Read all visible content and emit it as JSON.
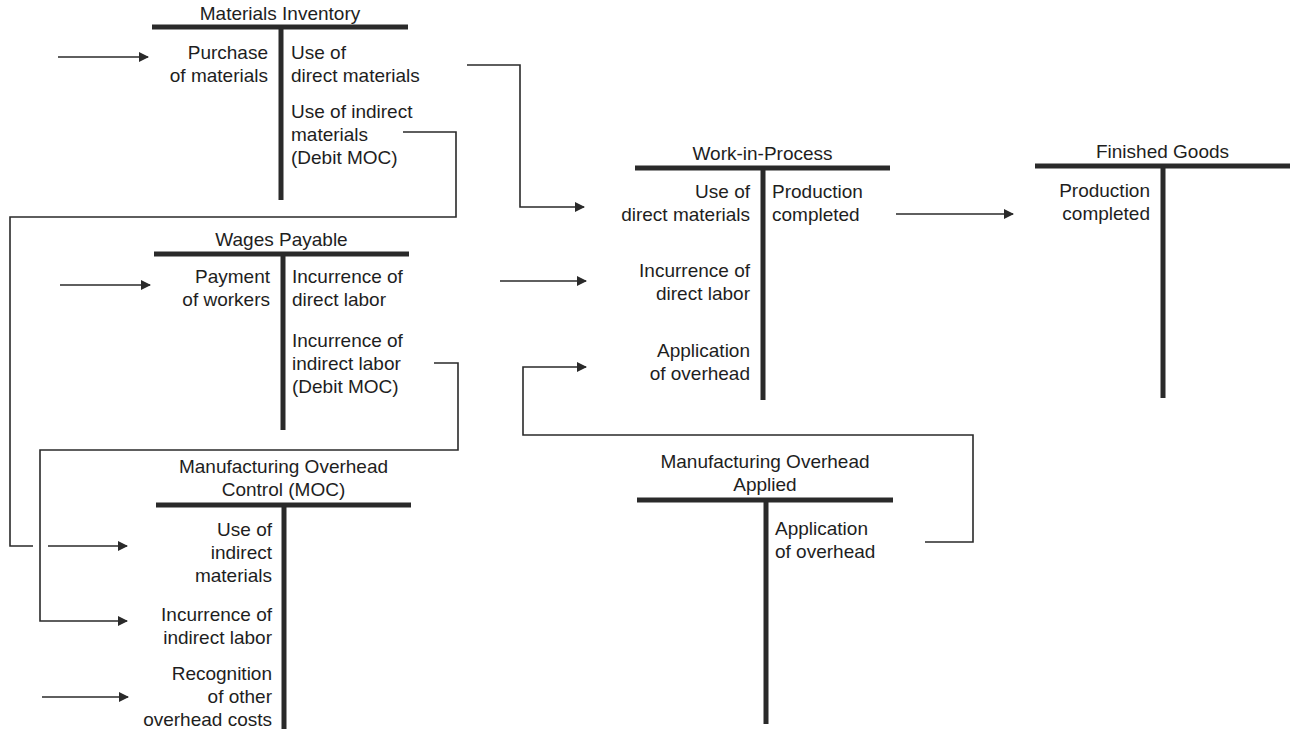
{
  "diagram": {
    "accounts": {
      "materials_inventory": {
        "title": "Materials Inventory",
        "debits": [
          "Purchase\nof materials"
        ],
        "credits": [
          "Use of\ndirect materials",
          "Use of indirect\nmaterials\n(Debit MOC)"
        ]
      },
      "wages_payable": {
        "title": "Wages Payable",
        "debits": [
          "Payment\nof workers"
        ],
        "credits": [
          "Incurrence of\ndirect labor",
          "Incurrence of\nindirect labor\n(Debit MOC)"
        ]
      },
      "moc": {
        "title": "Manufacturing Overhead\nControl (MOC)",
        "debits": [
          "Use of\nindirect\nmaterials",
          "Incurrence of\nindirect labor",
          "Recognition\nof other\noverhead costs"
        ],
        "credits": []
      },
      "wip": {
        "title": "Work-in-Process",
        "debits": [
          "Use of\ndirect materials",
          "Incurrence of\ndirect labor",
          "Application\nof overhead"
        ],
        "credits": [
          "Production\ncompleted"
        ]
      },
      "finished_goods": {
        "title": "Finished Goods",
        "debits": [
          "Production\ncompleted"
        ],
        "credits": []
      },
      "moa": {
        "title": "Manufacturing Overhead\nApplied",
        "debits": [],
        "credits": [
          "Application\nof overhead"
        ]
      }
    },
    "flows": [
      {
        "from": "external",
        "to": "materials_inventory.debit",
        "label": "Purchase of materials"
      },
      {
        "from": "materials_inventory.credit",
        "to": "wip.debit",
        "label": "Use of direct materials"
      },
      {
        "from": "materials_inventory.credit",
        "to": "moc.debit",
        "label": "Use of indirect materials"
      },
      {
        "from": "external",
        "to": "wages_payable.debit",
        "label": "Payment of workers"
      },
      {
        "from": "wages_payable.credit",
        "to": "wip.debit",
        "label": "Incurrence of direct labor"
      },
      {
        "from": "wages_payable.credit",
        "to": "moc.debit",
        "label": "Incurrence of indirect labor"
      },
      {
        "from": "external",
        "to": "moc.debit",
        "label": "Recognition of other overhead costs"
      },
      {
        "from": "moa.credit",
        "to": "wip.debit",
        "label": "Application of overhead"
      },
      {
        "from": "wip.credit",
        "to": "finished_goods.debit",
        "label": "Production completed"
      }
    ],
    "colors": {
      "line": "#2a2a2a",
      "text": "#1e1e1e",
      "background": "#ffffff"
    }
  }
}
